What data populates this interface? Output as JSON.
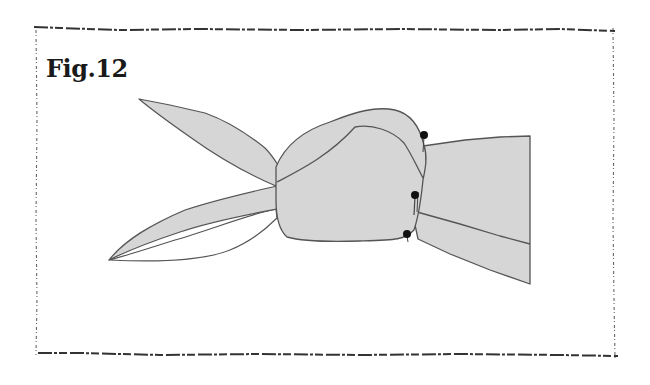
{
  "figure": {
    "label": "Fig.12",
    "colors": {
      "fill": "#d6d6d6",
      "outline": "#555555",
      "pin": "#111111",
      "frame": "#333333",
      "background": "#ffffff"
    },
    "parts": {
      "upper_left_ear": "upper-left-loop",
      "lower_left_ear": "lower-left-loop",
      "knot": "center-knot",
      "right_tail": "right-tail-band",
      "pins_count": "3"
    }
  }
}
